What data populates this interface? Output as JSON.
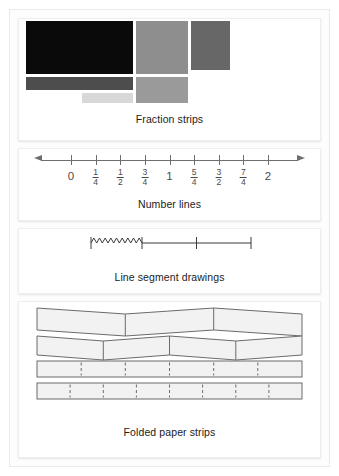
{
  "figure": {
    "background": "#ffffff",
    "frame_color": "#e9e9e9"
  },
  "panels": [
    {
      "id": "fraction-strips",
      "caption": "Fraction strips",
      "type": "colored-blocks",
      "blocks": [
        {
          "name": "block-black-large",
          "color": "#0a0a0a",
          "x": 7,
          "y": 2,
          "w": 107,
          "h": 53
        },
        {
          "name": "block-gray-medium",
          "color": "#8e8e8e",
          "x": 117,
          "y": 2,
          "w": 52,
          "h": 53
        },
        {
          "name": "block-gray-dark",
          "color": "#676767",
          "x": 172,
          "y": 2,
          "w": 39,
          "h": 49
        },
        {
          "name": "block-darkgray-bar",
          "color": "#4d4d4d",
          "x": 7,
          "y": 58,
          "w": 107,
          "h": 13
        },
        {
          "name": "block-gray-medium-small",
          "color": "#9a9a9a",
          "x": 117,
          "y": 58,
          "w": 52,
          "h": 26
        },
        {
          "name": "block-lightgray-bar",
          "color": "#d8d8d8",
          "x": 63,
          "y": 74,
          "w": 51,
          "h": 10
        }
      ]
    },
    {
      "id": "number-lines",
      "caption": "Number lines",
      "type": "number-line",
      "axis_color": "#6e6e6e",
      "ticks": [
        {
          "label": "0",
          "kind": "whole",
          "pos": 0.0
        },
        {
          "label": "1/4",
          "kind": "frac",
          "num": "1",
          "den": "4",
          "pos": 0.125
        },
        {
          "label": "1/2",
          "kind": "frac",
          "num": "1",
          "den": "2",
          "pos": 0.25
        },
        {
          "label": "3/4",
          "kind": "frac",
          "num": "3",
          "den": "4",
          "pos": 0.375
        },
        {
          "label": "1",
          "kind": "whole",
          "pos": 0.5
        },
        {
          "label": "5/4",
          "kind": "frac",
          "num": "5",
          "den": "4",
          "pos": 0.625
        },
        {
          "label": "3/2",
          "kind": "frac",
          "num": "3",
          "den": "2",
          "pos": 0.75
        },
        {
          "label": "7/4",
          "kind": "frac",
          "num": "7",
          "den": "4",
          "pos": 0.875
        },
        {
          "label": "2",
          "kind": "whole",
          "pos": 1.0
        }
      ]
    },
    {
      "id": "line-segments",
      "caption": "Line segment drawings",
      "type": "segment-diagram",
      "stroke_color": "#3a3a3a",
      "squiggle_note": "zigzag hand-drawn segment at left portion",
      "tick_count": 4
    },
    {
      "id": "folded-strips",
      "caption": "Folded paper strips",
      "type": "paper-strips",
      "stroke_color": "#6b6b6b",
      "fill_color": "#f2f2f2",
      "strips": [
        {
          "name": "strip-3-sections",
          "sections": 3,
          "folded": true,
          "dashed": false
        },
        {
          "name": "strip-4-sections",
          "sections": 4,
          "folded": true,
          "dashed": false
        },
        {
          "name": "strip-6-sections",
          "sections": 6,
          "folded": false,
          "dashed": true
        },
        {
          "name": "strip-8-sections",
          "sections": 8,
          "folded": false,
          "dashed": true
        }
      ]
    }
  ]
}
